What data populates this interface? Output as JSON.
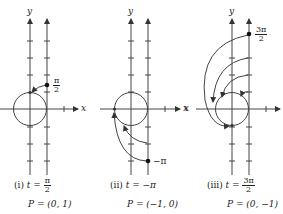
{
  "colors": {
    "stroke": "#444444",
    "text": "#222222",
    "background": "#ffffff"
  },
  "panels": [
    {
      "id": "i",
      "caption_prefix": "(i)",
      "t_var": "t",
      "eq": "=",
      "t_value": {
        "type": "fraction",
        "num": "π",
        "den": "2"
      },
      "point_label": "P = (0, 1)",
      "marker_label": {
        "type": "fraction",
        "num": "π",
        "den": "2"
      },
      "axis_x_label": "x",
      "axis_y_label": "y"
    },
    {
      "id": "ii",
      "caption_prefix": "(ii)",
      "t_var": "t",
      "eq": "=",
      "t_value_text": "−π",
      "point_label": "P = (−1, 0)",
      "marker_label_text": "−π",
      "axis_x_label": "x",
      "axis_y_label": "y"
    },
    {
      "id": "iii",
      "caption_prefix": "(iii)",
      "t_var": "t",
      "eq": "=",
      "t_value": {
        "type": "fraction",
        "num": "3π",
        "den": "2"
      },
      "point_label": "P = (0, −1)",
      "marker_label": {
        "type": "fraction",
        "num": "3π",
        "den": "2"
      },
      "axis_x_label": "x",
      "axis_y_label": "y"
    }
  ]
}
